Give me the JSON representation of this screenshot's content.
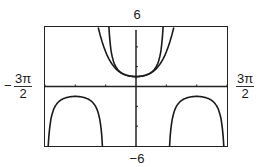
{
  "chart_data": {
    "type": "line",
    "title": "",
    "xlabel": "",
    "ylabel": "",
    "xlim": [
      -4.712,
      4.712
    ],
    "ylim": [
      -6,
      6
    ],
    "xlim_labels": {
      "min": "-3π/2",
      "max": "3π/2"
    },
    "ylim_labels": {
      "min": "-6",
      "max": "6"
    },
    "x_ticks": [
      -4.712,
      -3.1416,
      -1.5708,
      0,
      1.5708,
      3.1416,
      4.712
    ],
    "y_ticks": [
      -6,
      -4,
      -2,
      0,
      2,
      4,
      6
    ],
    "grid": false,
    "legend": null,
    "series": [
      {
        "name": "y = sec x",
        "x": [
          -4.4,
          -4.0,
          -3.6,
          -3.1416,
          -2.7,
          -2.3,
          -1.9,
          0,
          1.9,
          2.3,
          2.7,
          3.1416,
          3.6,
          4.0,
          4.4,
          -1.403,
          -1.2,
          -0.9,
          -0.6,
          -0.3,
          0.3,
          0.6,
          0.9,
          1.2,
          1.403
        ],
        "y": [
          -3.27,
          -1.53,
          -1.13,
          -1.0,
          -1.1,
          -1.5,
          -3.09,
          1.0,
          -3.09,
          -1.5,
          -1.1,
          -1.0,
          -1.13,
          -1.53,
          -3.27,
          6.0,
          2.76,
          1.61,
          1.21,
          1.05,
          1.05,
          1.21,
          1.61,
          2.76,
          6.0
        ]
      },
      {
        "name": "y = 1 + x²/2 + 5x⁴/24",
        "x": [
          -1.95,
          -1.6,
          -1.2,
          -0.8,
          -0.4,
          0,
          0.4,
          0.8,
          1.2,
          1.6,
          1.95
        ],
        "y": [
          5.95,
          3.65,
          2.15,
          1.41,
          1.09,
          1.0,
          1.09,
          1.41,
          2.15,
          3.65,
          5.95
        ]
      }
    ]
  },
  "labels": {
    "ymax": "6",
    "ymin": "−6",
    "xmin_sign": "−",
    "xmin_num": "3π",
    "xmin_den": "2",
    "xmax_num": "3π",
    "xmax_den": "2"
  }
}
